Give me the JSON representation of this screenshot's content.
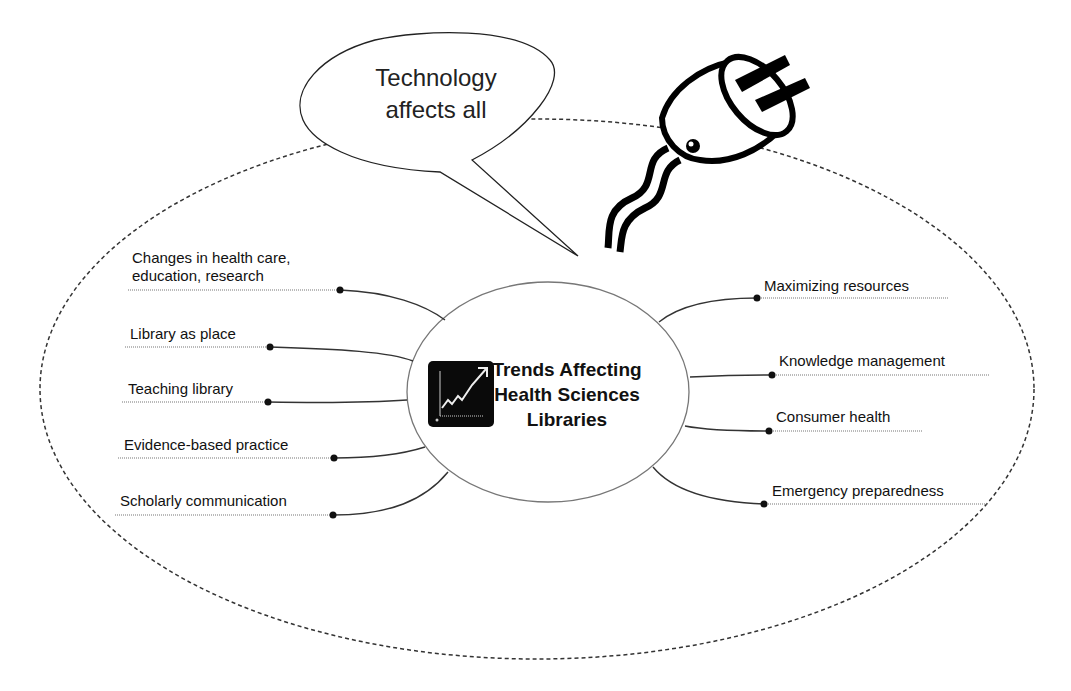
{
  "diagram": {
    "type": "mind-map",
    "central_topic": {
      "lines": [
        "Trends Affecting",
        "Health Sciences",
        "Libraries"
      ],
      "icon": "trend-chart-icon"
    },
    "callout": {
      "lines": [
        "Technology",
        "affects all"
      ],
      "icon": "electric-plug-icon"
    },
    "left_branches": [
      {
        "lines": [
          "Changes in health care,",
          "education, research"
        ]
      },
      {
        "lines": [
          "Library as place"
        ]
      },
      {
        "lines": [
          "Teaching library"
        ]
      },
      {
        "lines": [
          "Evidence-based practice"
        ]
      },
      {
        "lines": [
          "Scholarly communication"
        ]
      }
    ],
    "right_branches": [
      {
        "lines": [
          "Maximizing resources"
        ]
      },
      {
        "lines": [
          "Knowledge management"
        ]
      },
      {
        "lines": [
          "Consumer health"
        ]
      },
      {
        "lines": [
          "Emergency preparedness"
        ]
      }
    ],
    "colors": {
      "ink": "#111111",
      "background": "#ffffff",
      "icon_bg": "#0a0a0a"
    }
  }
}
